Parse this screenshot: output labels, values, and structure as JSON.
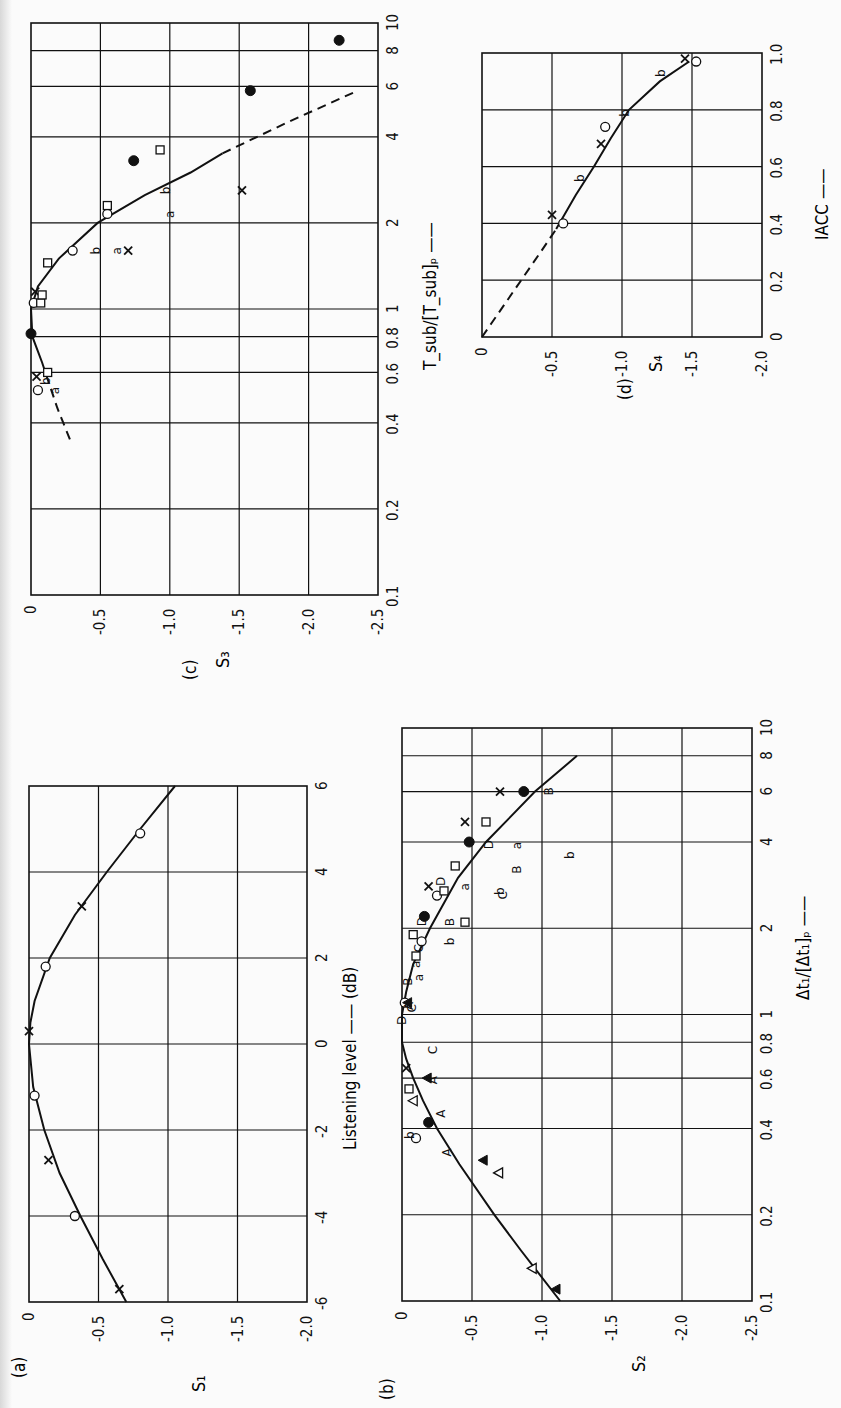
{
  "figure": {
    "orientation": "rotated 90° counter-clockwise (x-axis of each panel runs bottom-to-top, S-axis runs left-to-right)",
    "panels": [
      "a",
      "b",
      "c",
      "d"
    ]
  },
  "chart_data": [
    {
      "panel": "a",
      "panel_label": "(a)",
      "type": "line",
      "title": "",
      "xlabel": "Listening level → (dB)",
      "ylabel": "S1",
      "xscale": "linear",
      "xlim": [
        -6,
        6
      ],
      "ylim": [
        -2.0,
        0
      ],
      "xticks": [
        "-6",
        "-4",
        "-2",
        "0",
        "2",
        "4",
        "6"
      ],
      "yticks": [
        "0",
        "-0.5",
        "-1.0",
        "-1.5",
        "-2.0"
      ],
      "grid": true,
      "frame_px": {
        "left": 29,
        "right": 307,
        "top": 786,
        "bottom": 1302
      },
      "curve": [
        {
          "x": -6,
          "y": -0.7
        },
        {
          "x": -5,
          "y": -0.53
        },
        {
          "x": -4,
          "y": -0.37
        },
        {
          "x": -3,
          "y": -0.22
        },
        {
          "x": -2,
          "y": -0.11
        },
        {
          "x": -1,
          "y": -0.03
        },
        {
          "x": 0,
          "y": 0.0
        },
        {
          "x": 0.5,
          "y": -0.01
        },
        {
          "x": 1,
          "y": -0.04
        },
        {
          "x": 2,
          "y": -0.15
        },
        {
          "x": 3,
          "y": -0.33
        },
        {
          "x": 4,
          "y": -0.56
        },
        {
          "x": 5,
          "y": -0.8
        },
        {
          "x": 6,
          "y": -1.05
        }
      ],
      "series": [
        {
          "name": "o",
          "marker": "circle-open",
          "points": [
            {
              "x": -4.0,
              "y": -0.33
            },
            {
              "x": -1.2,
              "y": -0.04
            },
            {
              "x": 1.8,
              "y": -0.12
            },
            {
              "x": 4.9,
              "y": -0.8
            }
          ]
        },
        {
          "name": "x",
          "marker": "cross",
          "points": [
            {
              "x": -5.7,
              "y": -0.65
            },
            {
              "x": -2.7,
              "y": -0.14
            },
            {
              "x": 0.3,
              "y": 0.0
            },
            {
              "x": 3.2,
              "y": -0.38
            }
          ]
        }
      ]
    },
    {
      "panel": "b",
      "panel_label": "(b)",
      "type": "scatter",
      "title": "",
      "xlabel": "Δt1/[Δt1]p →",
      "ylabel": "S2",
      "xscale": "log",
      "xlim": [
        0.1,
        10
      ],
      "ylim": [
        -2.5,
        0
      ],
      "xticks": [
        "0.1",
        "0.2",
        "0.4",
        "0.6",
        "0.8",
        "1",
        "2",
        "4",
        "6",
        "8",
        "10"
      ],
      "yticks": [
        "0",
        "-0.5",
        "-1.0",
        "-1.5",
        "-2.0",
        "-2.5"
      ],
      "grid": true,
      "frame_px": {
        "left": 402,
        "right": 752,
        "top": 728,
        "bottom": 1301
      },
      "curve": [
        {
          "x": 0.1,
          "y": -1.13
        },
        {
          "x": 0.15,
          "y": -0.85
        },
        {
          "x": 0.2,
          "y": -0.66
        },
        {
          "x": 0.3,
          "y": -0.41
        },
        {
          "x": 0.4,
          "y": -0.25
        },
        {
          "x": 0.5,
          "y": -0.15
        },
        {
          "x": 0.6,
          "y": -0.08
        },
        {
          "x": 0.7,
          "y": -0.03
        },
        {
          "x": 0.8,
          "y": 0.0
        },
        {
          "x": 1.0,
          "y": 0.0
        },
        {
          "x": 1.2,
          "y": -0.03
        },
        {
          "x": 1.5,
          "y": -0.08
        },
        {
          "x": 2.0,
          "y": -0.2
        },
        {
          "x": 3.0,
          "y": -0.4
        },
        {
          "x": 4.0,
          "y": -0.6
        },
        {
          "x": 6.0,
          "y": -0.95
        },
        {
          "x": 8.0,
          "y": -1.25
        }
      ],
      "series": [
        {
          "name": "o",
          "marker": "circle-open",
          "points": [
            {
              "x": 0.37,
              "y": -0.1
            },
            {
              "x": 1.1,
              "y": -0.02
            },
            {
              "x": 1.8,
              "y": -0.14
            },
            {
              "x": 2.6,
              "y": -0.25
            }
          ]
        },
        {
          "name": "●",
          "marker": "circle-filled",
          "points": [
            {
              "x": 0.42,
              "y": -0.19
            },
            {
              "x": 2.2,
              "y": -0.16
            },
            {
              "x": 4.0,
              "y": -0.48
            },
            {
              "x": 6.0,
              "y": -0.87
            }
          ]
        },
        {
          "name": "x",
          "marker": "cross",
          "points": [
            {
              "x": 0.65,
              "y": -0.03
            },
            {
              "x": 2.8,
              "y": -0.19
            },
            {
              "x": 4.7,
              "y": -0.45
            },
            {
              "x": 6.0,
              "y": -0.7
            }
          ]
        },
        {
          "name": "□",
          "marker": "square-open",
          "points": [
            {
              "x": 0.55,
              "y": -0.05
            },
            {
              "x": 1.6,
              "y": -0.1
            },
            {
              "x": 1.9,
              "y": -0.08
            },
            {
              "x": 2.7,
              "y": -0.3
            },
            {
              "x": 3.3,
              "y": -0.38
            },
            {
              "x": 4.7,
              "y": -0.6
            },
            {
              "x": 2.1,
              "y": -0.45
            }
          ]
        },
        {
          "name": "△",
          "marker": "triangle-open",
          "points": [
            {
              "x": 0.5,
              "y": -0.08
            },
            {
              "x": 0.28,
              "y": -0.69
            },
            {
              "x": 0.13,
              "y": -0.93
            }
          ]
        },
        {
          "name": "▲",
          "marker": "triangle-filled",
          "points": [
            {
              "x": 0.6,
              "y": -0.18
            },
            {
              "x": 1.1,
              "y": -0.04
            },
            {
              "x": 0.31,
              "y": -0.58
            },
            {
              "x": 0.11,
              "y": -1.1
            }
          ]
        },
        {
          "name": "A",
          "marker": "letter-A",
          "points": [
            {
              "x": 0.33,
              "y": -0.32
            },
            {
              "x": 0.45,
              "y": -0.28
            },
            {
              "x": 0.59,
              "y": -0.22
            },
            {
              "x": 1.07,
              "y": -0.05
            }
          ]
        },
        {
          "name": "B",
          "marker": "letter-B",
          "points": [
            {
              "x": 1.3,
              "y": -0.04
            },
            {
              "x": 2.1,
              "y": -0.34
            },
            {
              "x": 3.2,
              "y": -0.82
            },
            {
              "x": 6.0,
              "y": -1.05
            }
          ]
        },
        {
          "name": "C",
          "marker": "letter-C",
          "points": [
            {
              "x": 0.75,
              "y": -0.22
            },
            {
              "x": 1.05,
              "y": -0.07
            },
            {
              "x": 1.7,
              "y": -0.12
            },
            {
              "x": 2.6,
              "y": -0.72
            }
          ]
        },
        {
          "name": "D",
          "marker": "letter-D",
          "points": [
            {
              "x": 0.95,
              "y": 0.0
            },
            {
              "x": 2.1,
              "y": -0.14
            },
            {
              "x": 2.9,
              "y": -0.28
            },
            {
              "x": 3.9,
              "y": -0.62
            }
          ]
        },
        {
          "name": "a",
          "marker": "letter-a",
          "points": [
            {
              "x": 1.35,
              "y": -0.12
            },
            {
              "x": 1.5,
              "y": -0.1
            },
            {
              "x": 2.8,
              "y": -0.45
            },
            {
              "x": 3.9,
              "y": -0.82
            }
          ]
        },
        {
          "name": "b",
          "marker": "letter-b",
          "points": [
            {
              "x": 0.38,
              "y": -0.06
            },
            {
              "x": 1.8,
              "y": -0.34
            },
            {
              "x": 2.7,
              "y": -0.7
            },
            {
              "x": 3.6,
              "y": -1.2
            }
          ]
        }
      ]
    },
    {
      "panel": "c",
      "panel_label": "(c)",
      "type": "scatter",
      "title": "",
      "xlabel": "Tsub/[Tsub]p →",
      "ylabel": "S3",
      "xscale": "log",
      "xlim": [
        0.1,
        10
      ],
      "ylim": [
        -2.5,
        0
      ],
      "xticks": [
        "0.1",
        "0.2",
        "0.4",
        "0.6",
        "0.8",
        "1",
        "2",
        "4",
        "6",
        "8",
        "10"
      ],
      "yticks": [
        "0",
        "-0.5",
        "-1.0",
        "-1.5",
        "-2.0",
        "-2.5"
      ],
      "grid": true,
      "frame_px": {
        "left": 31,
        "right": 378,
        "top": 23,
        "bottom": 595
      },
      "curve_dashed_low": [
        {
          "x": 0.35,
          "y": -0.28
        },
        {
          "x": 0.45,
          "y": -0.19
        },
        {
          "x": 0.55,
          "y": -0.13
        }
      ],
      "curve": [
        {
          "x": 0.55,
          "y": -0.13
        },
        {
          "x": 0.65,
          "y": -0.08
        },
        {
          "x": 0.8,
          "y": -0.01
        },
        {
          "x": 1.0,
          "y": 0.0
        },
        {
          "x": 1.2,
          "y": -0.05
        },
        {
          "x": 1.5,
          "y": -0.2
        },
        {
          "x": 2.0,
          "y": -0.48
        },
        {
          "x": 2.5,
          "y": -0.82
        },
        {
          "x": 3.0,
          "y": -1.15
        },
        {
          "x": 3.5,
          "y": -1.38
        }
      ],
      "curve_dashed_high": [
        {
          "x": 3.5,
          "y": -1.38
        },
        {
          "x": 4.5,
          "y": -1.85
        },
        {
          "x": 5.7,
          "y": -2.32
        }
      ],
      "series": [
        {
          "name": "o",
          "marker": "circle-open",
          "points": [
            {
              "x": 0.52,
              "y": -0.05
            },
            {
              "x": 1.05,
              "y": -0.02
            },
            {
              "x": 1.6,
              "y": -0.3
            },
            {
              "x": 2.15,
              "y": -0.55
            }
          ]
        },
        {
          "name": "●",
          "marker": "circle-filled",
          "points": [
            {
              "x": 0.82,
              "y": 0.0
            },
            {
              "x": 3.3,
              "y": -0.74
            },
            {
              "x": 5.8,
              "y": -1.58
            },
            {
              "x": 8.7,
              "y": -2.22
            }
          ]
        },
        {
          "name": "x",
          "marker": "cross",
          "points": [
            {
              "x": 0.58,
              "y": -0.04
            },
            {
              "x": 1.15,
              "y": -0.03
            },
            {
              "x": 1.6,
              "y": -0.7
            },
            {
              "x": 2.6,
              "y": -1.52
            }
          ]
        },
        {
          "name": "□",
          "marker": "square-open",
          "points": [
            {
              "x": 0.6,
              "y": -0.12
            },
            {
              "x": 1.05,
              "y": -0.07
            },
            {
              "x": 1.12,
              "y": -0.08
            },
            {
              "x": 1.45,
              "y": -0.12
            },
            {
              "x": 2.3,
              "y": -0.55
            },
            {
              "x": 3.6,
              "y": -0.93
            }
          ]
        },
        {
          "name": "a",
          "marker": "letter-a",
          "points": [
            {
              "x": 0.52,
              "y": -0.17
            },
            {
              "x": 1.6,
              "y": -0.62
            },
            {
              "x": 2.15,
              "y": -1.0
            }
          ]
        },
        {
          "name": "b",
          "marker": "letter-b",
          "points": [
            {
              "x": 0.56,
              "y": -0.11
            },
            {
              "x": 1.6,
              "y": -0.47
            },
            {
              "x": 2.6,
              "y": -0.97
            }
          ]
        }
      ]
    },
    {
      "panel": "d",
      "panel_label": "(d)",
      "type": "line",
      "title": "",
      "xlabel": "IACC →",
      "ylabel": "S4",
      "xscale": "linear",
      "xlim": [
        0,
        1.0
      ],
      "ylim": [
        -2.0,
        0
      ],
      "xticks": [
        "0",
        "0.2",
        "0.4",
        "0.6",
        "0.8",
        "1.0"
      ],
      "yticks": [
        "0",
        "-0.5",
        "-1.0",
        "-1.5",
        "-2.0"
      ],
      "grid": true,
      "frame_px": {
        "left": 482,
        "right": 762,
        "top": 53,
        "bottom": 337
      },
      "curve_dashed": [
        {
          "x": 0.0,
          "y": 0.0
        },
        {
          "x": 0.05,
          "y": -0.07
        },
        {
          "x": 0.1,
          "y": -0.14
        },
        {
          "x": 0.2,
          "y": -0.28
        },
        {
          "x": 0.3,
          "y": -0.42
        },
        {
          "x": 0.38,
          "y": -0.53
        }
      ],
      "curve": [
        {
          "x": 0.38,
          "y": -0.53
        },
        {
          "x": 0.5,
          "y": -0.67
        },
        {
          "x": 0.6,
          "y": -0.8
        },
        {
          "x": 0.7,
          "y": -0.92
        },
        {
          "x": 0.8,
          "y": -1.05
        },
        {
          "x": 0.9,
          "y": -1.27
        },
        {
          "x": 0.97,
          "y": -1.48
        }
      ],
      "series": [
        {
          "name": "o",
          "marker": "circle-open",
          "points": [
            {
              "x": 0.4,
              "y": -0.58
            },
            {
              "x": 0.74,
              "y": -0.88
            },
            {
              "x": 0.97,
              "y": -1.53
            }
          ]
        },
        {
          "name": "x",
          "marker": "cross",
          "points": [
            {
              "x": 0.43,
              "y": -0.5
            },
            {
              "x": 0.68,
              "y": -0.85
            },
            {
              "x": 0.98,
              "y": -1.45
            }
          ]
        },
        {
          "name": "b",
          "marker": "letter-b",
          "points": [
            {
              "x": 0.56,
              "y": -0.7
            },
            {
              "x": 0.79,
              "y": -1.02
            },
            {
              "x": 0.93,
              "y": -1.28
            }
          ]
        }
      ]
    }
  ],
  "labels": {
    "panel_a": "(a)",
    "panel_b": "(b)",
    "panel_c": "(c)",
    "panel_d": "(d)",
    "ylabel_a": "S₁",
    "ylabel_b": "S₂",
    "ylabel_c": "S₃",
    "ylabel_d": "S₄",
    "xlabel_a": "Listening level  ——  (dB)",
    "xlabel_b": "Δt₁/[Δt₁]ₚ  ——",
    "xlabel_c": "T_sub/[T_sub]ₚ  ——",
    "xlabel_d": "IACC  ——"
  }
}
